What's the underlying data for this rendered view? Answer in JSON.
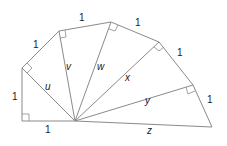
{
  "diagram": {
    "side_labels": {
      "base": "1",
      "vertical": "1",
      "outer1": "1",
      "outer2": "1",
      "outer3": "1",
      "outer4": "1",
      "outer5": "1"
    },
    "hypotenuse_labels": {
      "u": "u",
      "v": "v",
      "w": "w",
      "x": "x",
      "y": "y",
      "z": "z"
    },
    "colors": {
      "line": "#8a8a8a",
      "text": "#1a1a1a",
      "background": "#ffffff"
    }
  }
}
